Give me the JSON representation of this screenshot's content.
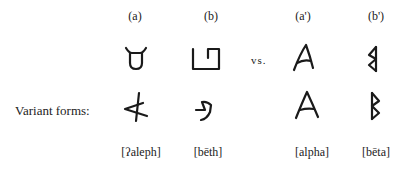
{
  "figure": {
    "columns": [
      {
        "id": "a",
        "label": "(a)",
        "name": "[ʔaleph]",
        "script": "Semitic"
      },
      {
        "id": "b",
        "label": "(b)",
        "name": "[bēth]",
        "script": "Semitic"
      },
      {
        "id": "a_prime",
        "label": "(a')",
        "name": "[alpha]",
        "script": "Greek"
      },
      {
        "id": "b_prime",
        "label": "(b')",
        "name": "[bēta]",
        "script": "Greek"
      }
    ],
    "comparison_label": "vs.",
    "row_label": "Variant forms:",
    "glyph_icons": {
      "a_main": "ox-head-aleph-glyph",
      "b_main": "house-beth-glyph",
      "a_variant": "rotated-aleph-glyph",
      "b_variant": "curved-beth-glyph",
      "a_prime_main": "alpha-glyph",
      "b_prime_main": "reversed-beta-glyph",
      "a_prime_variant": "alpha-variant-glyph",
      "b_prime_variant": "beta-variant-glyph"
    }
  }
}
